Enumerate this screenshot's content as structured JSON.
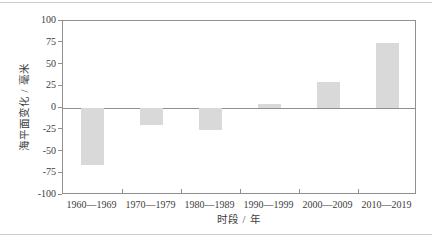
{
  "chart_data": {
    "type": "bar",
    "title": "",
    "categories": [
      "1960—1969",
      "1970—1979",
      "1980—1989",
      "1990—1999",
      "2000—2009",
      "2010—2019"
    ],
    "values": [
      -65,
      -20,
      -25,
      5,
      30,
      75
    ],
    "xlabel": "时段 / 年",
    "ylabel": "海平面变化 / 毫米",
    "ylim": [
      -100,
      100
    ],
    "yticks": [
      100,
      75,
      50,
      25,
      0,
      -25,
      -50,
      -75,
      -100
    ],
    "grid": false,
    "legend": "none",
    "bar_color": "#d9d9d9",
    "axis_color": "#909090",
    "text_color": "#3d3d3d"
  }
}
